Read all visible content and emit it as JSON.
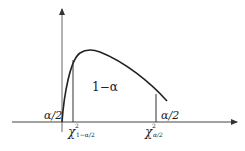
{
  "diagram": {
    "labels": {
      "center_area": "1−α",
      "left_tail": "α/2",
      "right_tail": "α/2",
      "left_critical_base": "χ",
      "left_critical_sup": "2",
      "left_critical_sub": "1−α/2",
      "right_critical_base": "χ",
      "right_critical_sup": "2",
      "right_critical_sub": "α/2"
    },
    "colors": {
      "stroke": "#222222",
      "axis": "#444444",
      "background": "#ffffff"
    }
  }
}
